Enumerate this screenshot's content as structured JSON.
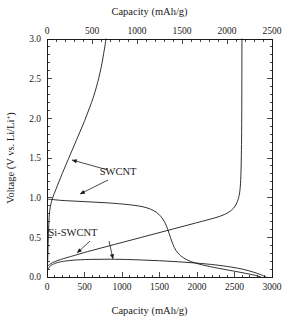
{
  "chart_data": {
    "type": "line",
    "title": "",
    "xlabel": "Capacity (mAh/g)",
    "xlabel_top": "Capacity (mAh/g)",
    "ylabel": "Voltage (V vs. Li/Li+)",
    "ylabel_parts": {
      "main": "Voltage (V vs. Li/Li",
      "superscript": "+",
      "tail": ")"
    },
    "grid": false,
    "legend_position": "inline-annotations",
    "axes": {
      "bottom": {
        "label": "Capacity (mAh/g)",
        "range": [
          0,
          3000
        ],
        "ticks": [
          0,
          500,
          1000,
          1500,
          2000,
          2500,
          3000
        ],
        "tick_labels": [
          "0",
          "500",
          "1000",
          "1500",
          "2000",
          "2500",
          "3000"
        ],
        "minor_tick_interval": 100
      },
      "top": {
        "label": "Capacity (mAh/g)",
        "range": [
          0,
          2500
        ],
        "ticks": [
          0,
          500,
          1000,
          1500,
          2000,
          2500
        ],
        "tick_labels": [
          "0",
          "500",
          "1000",
          "1500",
          "2000",
          "2500"
        ],
        "minor_tick_interval": 100
      },
      "left": {
        "label": "Voltage (V vs. Li/Li+)",
        "range": [
          0.0,
          3.0
        ],
        "ticks": [
          0.0,
          0.5,
          1.0,
          1.5,
          2.0,
          2.5,
          3.0
        ],
        "tick_labels": [
          "0.0",
          "0.5",
          "1.0",
          "1.5",
          "2.0",
          "2.5",
          "3.0"
        ],
        "minor_tick_interval": 0.1
      },
      "right": {
        "range": [
          0.0,
          3.0
        ],
        "minor_tick_interval": 0.1
      }
    },
    "annotations": [
      {
        "text": "SWCNT",
        "x_px": 118,
        "y_px": 175
      },
      {
        "text": "Si-SWCNT",
        "x_px": 73,
        "y_px": 236
      }
    ],
    "series": [
      {
        "name": "SWCNT charge",
        "axis": "top",
        "color": "#1a1a1a",
        "points": [
          [
            5,
            0.1
          ],
          [
            10,
            0.3
          ],
          [
            16,
            0.55
          ],
          [
            24,
            0.75
          ],
          [
            36,
            0.88
          ],
          [
            55,
            0.97
          ],
          [
            80,
            1.05
          ],
          [
            115,
            1.15
          ],
          [
            150,
            1.25
          ],
          [
            190,
            1.36
          ],
          [
            235,
            1.48
          ],
          [
            280,
            1.6
          ],
          [
            325,
            1.72
          ],
          [
            370,
            1.84
          ],
          [
            415,
            1.96
          ],
          [
            455,
            2.08
          ],
          [
            495,
            2.2
          ],
          [
            530,
            2.32
          ],
          [
            562,
            2.45
          ],
          [
            590,
            2.58
          ],
          [
            612,
            2.7
          ],
          [
            630,
            2.82
          ],
          [
            645,
            2.92
          ],
          [
            655,
            3.0
          ]
        ]
      },
      {
        "name": "SWCNT discharge",
        "axis": "bottom",
        "color": "#1a1a1a",
        "points": [
          [
            20,
            0.98
          ],
          [
            90,
            0.975
          ],
          [
            200,
            0.965
          ],
          [
            400,
            0.955
          ],
          [
            600,
            0.945
          ],
          [
            800,
            0.935
          ],
          [
            1000,
            0.92
          ],
          [
            1150,
            0.905
          ],
          [
            1280,
            0.885
          ],
          [
            1380,
            0.855
          ],
          [
            1460,
            0.815
          ],
          [
            1520,
            0.76
          ],
          [
            1570,
            0.69
          ],
          [
            1610,
            0.6
          ],
          [
            1645,
            0.5
          ],
          [
            1680,
            0.41
          ],
          [
            1720,
            0.335
          ],
          [
            1780,
            0.27
          ],
          [
            1870,
            0.215
          ],
          [
            2000,
            0.17
          ],
          [
            2180,
            0.13
          ],
          [
            2400,
            0.09
          ],
          [
            2600,
            0.055
          ],
          [
            2780,
            0.02
          ],
          [
            2850,
            0.0
          ]
        ]
      },
      {
        "name": "Si-SWCNT charge",
        "axis": "top",
        "color": "#1a1a1a",
        "points": [
          [
            10,
            0.14
          ],
          [
            60,
            0.18
          ],
          [
            150,
            0.22
          ],
          [
            300,
            0.27
          ],
          [
            450,
            0.32
          ],
          [
            600,
            0.365
          ],
          [
            750,
            0.41
          ],
          [
            900,
            0.455
          ],
          [
            1050,
            0.5
          ],
          [
            1200,
            0.545
          ],
          [
            1350,
            0.59
          ],
          [
            1500,
            0.635
          ],
          [
            1650,
            0.68
          ],
          [
            1800,
            0.725
          ],
          [
            1920,
            0.765
          ],
          [
            2010,
            0.81
          ],
          [
            2075,
            0.87
          ],
          [
            2115,
            0.95
          ],
          [
            2140,
            1.06
          ],
          [
            2152,
            1.22
          ],
          [
            2158,
            1.45
          ],
          [
            2162,
            1.75
          ],
          [
            2164,
            2.1
          ],
          [
            2165,
            2.5
          ],
          [
            2166,
            3.0
          ]
        ]
      },
      {
        "name": "Si-SWCNT discharge",
        "axis": "bottom",
        "color": "#1a1a1a",
        "points": [
          [
            8,
            0.09
          ],
          [
            30,
            0.125
          ],
          [
            70,
            0.155
          ],
          [
            140,
            0.182
          ],
          [
            250,
            0.202
          ],
          [
            400,
            0.215
          ],
          [
            600,
            0.222
          ],
          [
            800,
            0.224
          ],
          [
            1000,
            0.222
          ],
          [
            1250,
            0.215
          ],
          [
            1500,
            0.205
          ],
          [
            1750,
            0.192
          ],
          [
            2000,
            0.175
          ],
          [
            2250,
            0.152
          ],
          [
            2450,
            0.126
          ],
          [
            2620,
            0.096
          ],
          [
            2750,
            0.062
          ],
          [
            2850,
            0.03
          ],
          [
            2920,
            0.0
          ]
        ]
      }
    ]
  },
  "geometry": {
    "plot_left_px": 47,
    "plot_right_px": 272,
    "plot_top_px": 39,
    "plot_bottom_px": 277
  }
}
